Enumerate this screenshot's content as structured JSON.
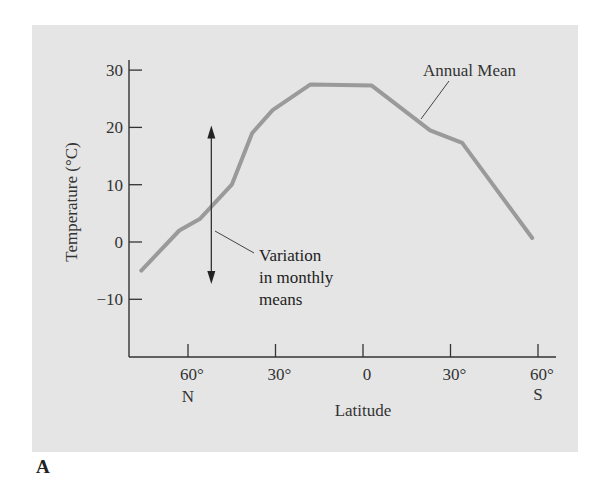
{
  "panel_label": "A",
  "chart_data": {
    "type": "line",
    "title": "",
    "xlabel": "Latitude",
    "ylabel": "Temperature (°C)",
    "x_unit": "degrees latitude (positive = N, negative = S)",
    "ylim": [
      -18,
      32
    ],
    "xlim": [
      80,
      -66
    ],
    "yticks": [
      30,
      20,
      10,
      0,
      -10
    ],
    "ytick_labels": [
      "30",
      "20",
      "10",
      "0",
      "−10"
    ],
    "xticks": [
      60,
      30,
      0,
      -30,
      -60
    ],
    "xtick_labels": [
      "60°",
      "30°",
      "0",
      "30°",
      "60°"
    ],
    "xtick_sublabels": [
      "N",
      "",
      "",
      "",
      "S"
    ],
    "grid": false,
    "series": [
      {
        "name": "Annual Mean",
        "color": "#9a9a9a",
        "x": [
          76,
          63,
          56,
          45,
          38,
          31,
          18,
          -3,
          -23,
          -34,
          -58
        ],
        "values": [
          -5,
          2,
          4,
          10,
          19,
          23,
          27.5,
          27.3,
          19.5,
          17.3,
          0.7
        ]
      }
    ],
    "annotations": [
      {
        "text": "Annual Mean",
        "type": "leader-label",
        "points_to_lat": -20
      },
      {
        "text": "Variation in monthly means",
        "lines": [
          "Variation",
          "in monthly",
          "means"
        ],
        "type": "double-arrow",
        "at_lat": 52,
        "range": [
          -7,
          20
        ]
      }
    ]
  },
  "labels": {
    "annual_mean": "Annual Mean",
    "variation_line1": "Variation",
    "variation_line2": "in monthly",
    "variation_line3": "means",
    "xlabel": "Latitude",
    "ylabel": "Temperature (°C)",
    "x_n": "N",
    "x_s": "S"
  }
}
